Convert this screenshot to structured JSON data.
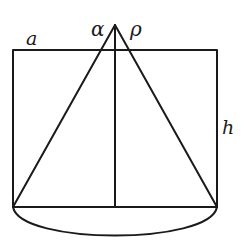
{
  "diagram": {
    "stroke_color": "#1a1a1a",
    "background": "#ffffff",
    "labels": {
      "a": "a",
      "alpha": "α",
      "rho": "ρ",
      "h": "h"
    },
    "points": {
      "apex": [
        115,
        25
      ],
      "rect_top_left": [
        13,
        50
      ],
      "rect_top_right": [
        217,
        50
      ],
      "rect_bottom_left": [
        13,
        207
      ],
      "rect_bottom_right": [
        217,
        207
      ],
      "axis_foot": [
        115,
        207
      ],
      "arc_lowest": [
        115,
        238
      ]
    }
  }
}
